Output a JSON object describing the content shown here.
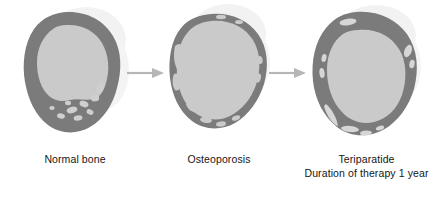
{
  "figure": {
    "background_color": "#ffffff",
    "cortical_color": "#7b7b7b",
    "marrow_color": "#cacaca",
    "lacuna_color": "#d6d6d6",
    "halo_color": "#f1f1f1",
    "arrow_color": "#b6b6b6",
    "text_color": "#161616"
  },
  "panels": [
    {
      "id": "normal-bone",
      "label_line1": "Normal bone",
      "label_line2": "",
      "description": "Thick continuous dark cortical ring with large light marrow cavity and small trabecular spaces in the lower right cortex"
    },
    {
      "id": "osteoporosis",
      "label_line1": "Osteoporosis",
      "label_line2": "",
      "description": "Markedly thinned irregular cortical shell with enlarged marrow cavity and porous ragged margins"
    },
    {
      "id": "teriparatide",
      "label_line1": "Teriparatide",
      "label_line2": "Duration of therapy 1 year",
      "description": "Restored thicker cortical ring with residual light lacunae within the cortex"
    }
  ],
  "arrows": [
    {
      "id": "arrow-normal-to-osteoporosis",
      "direction": "right"
    },
    {
      "id": "arrow-osteoporosis-to-teriparatide",
      "direction": "right"
    }
  ]
}
